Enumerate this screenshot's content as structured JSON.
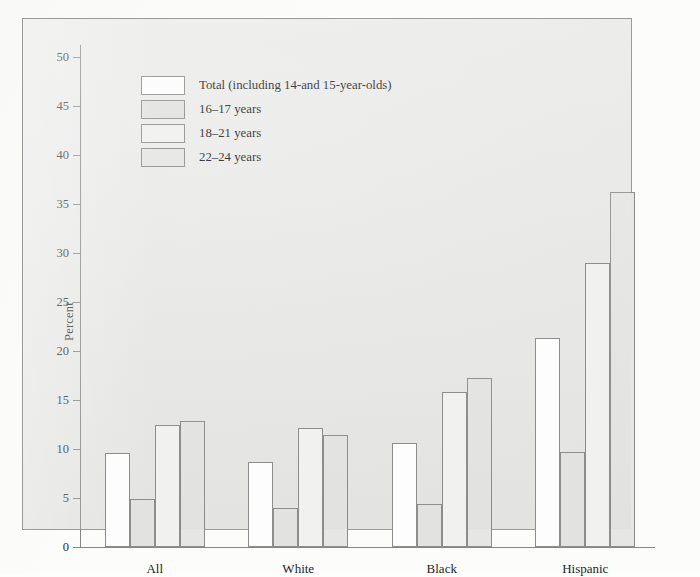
{
  "chart_data": {
    "type": "bar",
    "title": "",
    "xlabel": "",
    "ylabel": "Percent",
    "ylim": [
      0,
      50
    ],
    "ytick_step": 5,
    "yticks": [
      0,
      5,
      10,
      15,
      20,
      25,
      30,
      35,
      40,
      45,
      50
    ],
    "grid": false,
    "legend_position": "top-left inside plot",
    "categories": [
      "All",
      "White",
      "Black",
      "Hispanic"
    ],
    "series": [
      {
        "name": "Total (including 14-and 15-year-olds)",
        "fill": "#fdfdfd",
        "values": [
          9.6,
          8.7,
          10.6,
          21.3
        ]
      },
      {
        "name": "16–17 years",
        "fill": "#e2e2e0",
        "values": [
          4.9,
          4.0,
          4.4,
          9.7
        ]
      },
      {
        "name": "18–21 years",
        "fill": "#f1f1ef",
        "values": [
          12.4,
          12.1,
          15.8,
          29.0
        ]
      },
      {
        "name": "22–24 years",
        "fill": "#e6e6e4",
        "values": [
          12.9,
          11.4,
          17.2,
          36.2
        ]
      }
    ]
  },
  "figure": {
    "panel_background": "#e9e9e8",
    "page_background": "#fcfcfb",
    "axis_color": "#868684",
    "bar_stroke": "#8d8d8b",
    "text_color": "#1f1f1e"
  }
}
